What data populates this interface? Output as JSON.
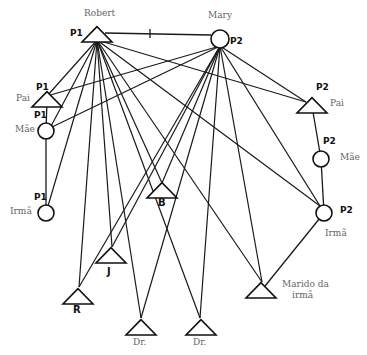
{
  "nodes": [
    {
      "id": "robert",
      "shape": "triangle",
      "label": "Robert",
      "tag": "P1"
    },
    {
      "id": "mary",
      "shape": "circle",
      "label": "Mary",
      "tag": "P2"
    },
    {
      "id": "pai1",
      "shape": "triangle",
      "label": "Pai",
      "tag": "P1"
    },
    {
      "id": "mae1",
      "shape": "circle",
      "label": "Mãe",
      "tag": "P1"
    },
    {
      "id": "irma1",
      "shape": "circle",
      "label": "Irmã",
      "tag": "P1"
    },
    {
      "id": "pai2",
      "shape": "triangle",
      "label": "Pai",
      "tag": "P2"
    },
    {
      "id": "mae2",
      "shape": "circle",
      "label": "Mãe",
      "tag": "P2"
    },
    {
      "id": "irma2",
      "shape": "circle",
      "label": "Irmã",
      "tag": "P2"
    },
    {
      "id": "b",
      "shape": "triangle",
      "label": "B",
      "tag": ""
    },
    {
      "id": "j",
      "shape": "triangle",
      "label": "J",
      "tag": ""
    },
    {
      "id": "r",
      "shape": "triangle",
      "label": "R",
      "tag": ""
    },
    {
      "id": "dr1",
      "shape": "triangle",
      "label": "Dr.",
      "tag": ""
    },
    {
      "id": "dr2",
      "shape": "triangle",
      "label": "Dr.",
      "tag": ""
    },
    {
      "id": "marido",
      "shape": "triangle",
      "label": "Marido da irmã",
      "tag": ""
    }
  ],
  "labels": {
    "robert": "Robert",
    "mary": "Mary",
    "pai1": "Pai",
    "mae1": "Mãe",
    "irma1": "Irmã",
    "pai2": "Pai",
    "mae2": "Mãe",
    "irma2": "Irmã",
    "b": "B",
    "j": "J",
    "r": "R",
    "dr1": "Dr.",
    "dr2": "Dr.",
    "marido_line1": "Marido da",
    "marido_line2": "irmã",
    "tag_p1": "P1",
    "tag_p2": "P2"
  },
  "marriage": {
    "from": "robert",
    "to": "mary"
  },
  "kinship_edges": [
    [
      "pai1",
      "mae1"
    ],
    [
      "mae1",
      "irma1"
    ],
    [
      "pai2",
      "mae2"
    ],
    [
      "mae2",
      "irma2"
    ],
    [
      "irma2",
      "marido"
    ]
  ],
  "edges": [
    [
      "robert",
      "pai1"
    ],
    [
      "robert",
      "mae1"
    ],
    [
      "robert",
      "irma1"
    ],
    [
      "robert",
      "pai2"
    ],
    [
      "robert",
      "irma2"
    ],
    [
      "robert",
      "b"
    ],
    [
      "robert",
      "j"
    ],
    [
      "robert",
      "r"
    ],
    [
      "robert",
      "dr1"
    ],
    [
      "robert",
      "dr2"
    ],
    [
      "robert",
      "marido"
    ],
    [
      "mary",
      "pai1"
    ],
    [
      "mary",
      "mae1"
    ],
    [
      "mary",
      "pai2"
    ],
    [
      "mary",
      "irma2"
    ],
    [
      "mary",
      "b"
    ],
    [
      "mary",
      "j"
    ],
    [
      "mary",
      "r"
    ],
    [
      "mary",
      "dr1"
    ],
    [
      "mary",
      "dr2"
    ],
    [
      "mary",
      "marido"
    ]
  ]
}
